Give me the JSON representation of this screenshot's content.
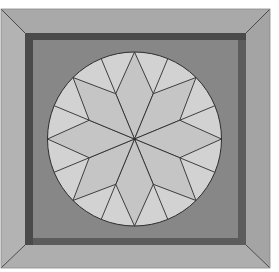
{
  "block": {
    "pattern": "LeMoyne star in circle",
    "star_points": 8,
    "colors": {
      "page_background": "#ffffff",
      "frame_top": "#a9a9a9",
      "frame_left": "#b3b3b3",
      "frame_right": "#a4a4a4",
      "frame_bottom": "#aeaeae",
      "frame_outline": "#3a3a3a",
      "inner_border": "#5c5c5c",
      "inner_border_shadow": "#4a4a4a",
      "panel": "#878787",
      "circle_background": "#d2d2d2",
      "diamond": "#c5c5c5",
      "seam_line": "#2e2e2e"
    }
  }
}
